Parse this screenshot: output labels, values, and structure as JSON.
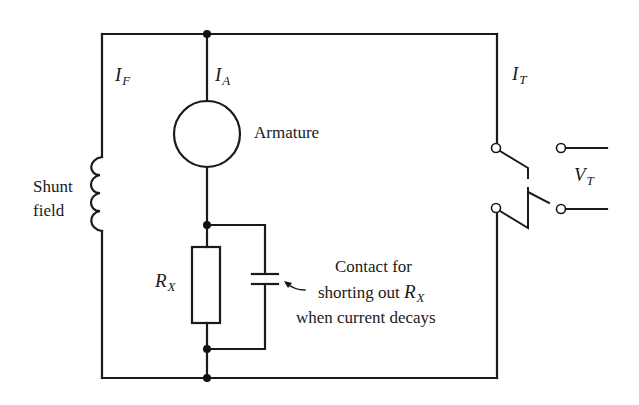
{
  "diagram": {
    "type": "circuit-schematic",
    "title": "",
    "labels": {
      "field_current": {
        "main": "I",
        "sub": "F"
      },
      "armature_current": {
        "main": "I",
        "sub": "A"
      },
      "terminal_current": {
        "main": "I",
        "sub": "T"
      },
      "terminal_voltage": {
        "main": "V",
        "sub": "T"
      },
      "resistor": {
        "main": "R",
        "sub": "X"
      },
      "armature": "Armature",
      "shunt_line1": "Shunt",
      "shunt_line2": "field",
      "contact_line1": "Contact for",
      "contact_line2_prefix": "shorting out ",
      "contact_line2_var": {
        "main": "R",
        "sub": "X"
      },
      "contact_line3": "when current decays"
    },
    "components": [
      {
        "id": "shunt-field",
        "kind": "inductor",
        "label": "Shunt field"
      },
      {
        "id": "armature",
        "kind": "machine-circle",
        "label": "Armature"
      },
      {
        "id": "rx",
        "kind": "resistor",
        "label": "R_X"
      },
      {
        "id": "shorting-contact",
        "kind": "contact",
        "label": "Contact for shorting out R_X when current decays"
      },
      {
        "id": "line-switch",
        "kind": "double-pole-switch",
        "label": ""
      },
      {
        "id": "terminals",
        "kind": "terminal-pair",
        "label": "V_T"
      }
    ],
    "colors": {
      "ink": "#1a1a1a",
      "background": "#ffffff"
    }
  }
}
